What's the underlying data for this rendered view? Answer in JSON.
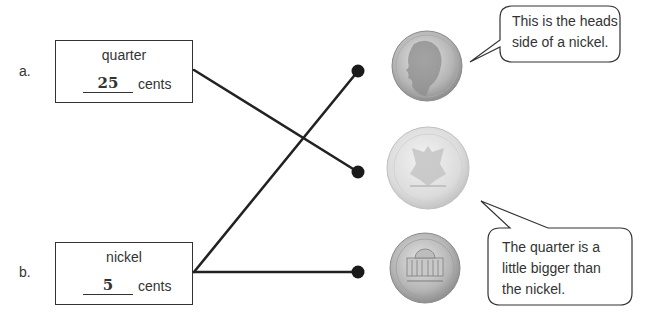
{
  "items": [
    {
      "letter": "a.",
      "name": "quarter",
      "value": "25",
      "unit": "cents"
    },
    {
      "letter": "b.",
      "name": "nickel",
      "value": "5",
      "unit": "cents"
    }
  ],
  "coins": [
    {
      "name": "nickel-heads",
      "description": "Nickel, heads side (Jefferson profile)"
    },
    {
      "name": "quarter-tails",
      "description": "Quarter, tails side (eagle)"
    },
    {
      "name": "nickel-tails",
      "description": "Nickel, tails side (Monticello)"
    }
  ],
  "callouts": {
    "top": {
      "line1": "This is the heads",
      "line2": "side of a nickel."
    },
    "bottom": {
      "line1": "The quarter is a",
      "line2": "little bigger than",
      "line3": "the nickel."
    }
  },
  "colors": {
    "line": "#222222",
    "box_border": "#333333",
    "coin_light": "#d9d9d9",
    "coin_dark": "#9a9a9a"
  }
}
